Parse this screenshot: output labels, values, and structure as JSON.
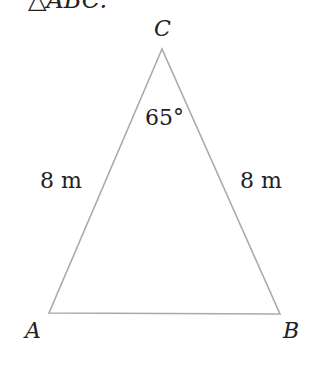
{
  "caption": "△ABC.",
  "vertices": {
    "A": "A",
    "B": "B",
    "C": "C"
  },
  "side_labels": {
    "AC": "8 m",
    "BC": "8 m"
  },
  "angle_label": "65°",
  "colors": {
    "line": "#aaaaaa",
    "text": "#222222"
  }
}
